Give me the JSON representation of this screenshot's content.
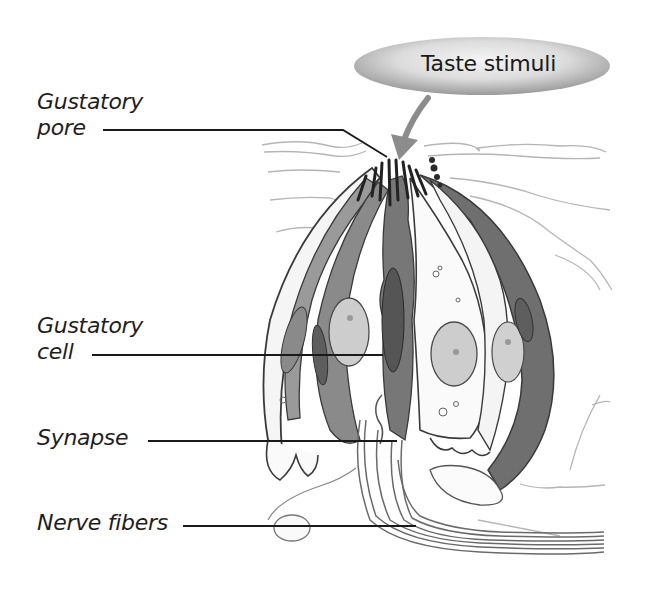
{
  "figure": {
    "callout": {
      "text": "Taste stimuli",
      "arrow": "curved-down-arrow",
      "colors": {
        "edge": "#9c9c9c",
        "center": "#f2f2f2",
        "arrow": "#8c8c8c"
      }
    },
    "labels": [
      {
        "id": "gustatory-pore",
        "lines": [
          "Gustatory",
          "pore"
        ]
      },
      {
        "id": "gustatory-cell",
        "lines": [
          "Gustatory",
          "cell"
        ]
      },
      {
        "id": "synapse",
        "lines": [
          "Synapse"
        ]
      },
      {
        "id": "nerve-fibers",
        "lines": [
          "Nerve fibers"
        ]
      }
    ],
    "colors": {
      "leader_line": "#1a1a1a",
      "cell_dark": "#6f6f6f",
      "cell_mid": "#8e8e8e",
      "nucleus": "#c9c9c9",
      "outline": "#3a3a3a",
      "epithelium": "#b8b8b8"
    }
  }
}
